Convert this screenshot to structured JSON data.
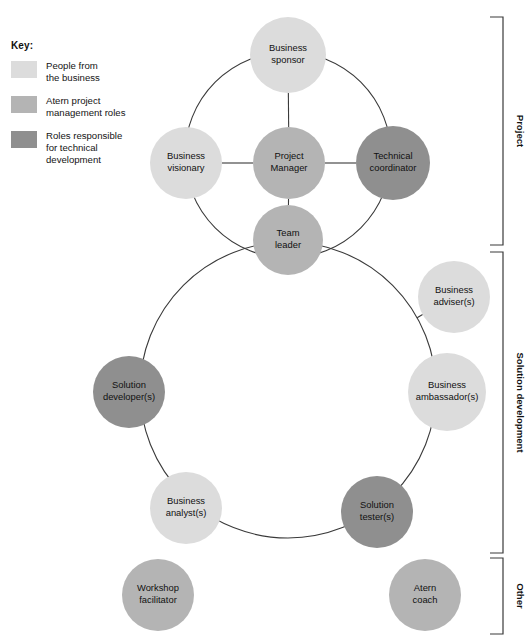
{
  "key": {
    "title": "Key:",
    "items": [
      {
        "color": "#dcdcdc",
        "label": "People from\nthe business"
      },
      {
        "color": "#b4b4b4",
        "label": "Atern project\nmanagement roles"
      },
      {
        "color": "#8f8f8f",
        "label": "Roles responsible\nfor technical\ndevelopment"
      }
    ]
  },
  "colors": {
    "business": "#dcdcdc",
    "management": "#b4b4b4",
    "technical": "#8f8f8f",
    "stroke": "#3a3a3a",
    "text": "#111111",
    "background": "#ffffff"
  },
  "diagram": {
    "nodes": [
      {
        "id": "business-sponsor",
        "lines": [
          "Business",
          "sponsor"
        ],
        "cx": 288,
        "cy": 55,
        "r": 38,
        "category": "business",
        "color": "#dcdcdc"
      },
      {
        "id": "business-visionary",
        "lines": [
          "Business",
          "visionary"
        ],
        "cx": 186,
        "cy": 163,
        "r": 36,
        "category": "business",
        "color": "#dcdcdc"
      },
      {
        "id": "project-manager",
        "lines": [
          "Project",
          "Manager"
        ],
        "cx": 289,
        "cy": 163,
        "r": 36,
        "category": "management",
        "color": "#b4b4b4"
      },
      {
        "id": "technical-coordinator",
        "lines": [
          "Technical",
          "coordinator"
        ],
        "cx": 393,
        "cy": 163,
        "r": 37,
        "category": "technical",
        "color": "#8f8f8f"
      },
      {
        "id": "team-leader",
        "lines": [
          "Team",
          "leader"
        ],
        "cx": 288,
        "cy": 240,
        "r": 35,
        "category": "management",
        "color": "#b4b4b4"
      },
      {
        "id": "business-adviser",
        "lines": [
          "Business",
          "adviser(s)"
        ],
        "cx": 454,
        "cy": 297,
        "r": 36,
        "category": "business",
        "color": "#dcdcdc"
      },
      {
        "id": "solution-developer",
        "lines": [
          "Solution",
          "developer(s)"
        ],
        "cx": 129,
        "cy": 392,
        "r": 36,
        "category": "technical",
        "color": "#8f8f8f"
      },
      {
        "id": "business-ambassador",
        "lines": [
          "Business",
          "ambassador(s)"
        ],
        "cx": 447,
        "cy": 392,
        "r": 39,
        "category": "business",
        "color": "#dcdcdc"
      },
      {
        "id": "business-analyst",
        "lines": [
          "Business",
          "analyst(s)"
        ],
        "cx": 186,
        "cy": 508,
        "r": 36,
        "category": "business",
        "color": "#dcdcdc"
      },
      {
        "id": "solution-tester",
        "lines": [
          "Solution",
          "tester(s)"
        ],
        "cx": 377,
        "cy": 512,
        "r": 36,
        "category": "technical",
        "color": "#8f8f8f"
      },
      {
        "id": "workshop-facilitator",
        "lines": [
          "Workshop",
          "facilitator"
        ],
        "cx": 158,
        "cy": 595,
        "r": 36,
        "category": "management",
        "color": "#b4b4b4"
      },
      {
        "id": "atern-coach",
        "lines": [
          "Atern",
          "coach"
        ],
        "cx": 425,
        "cy": 595,
        "r": 36,
        "category": "management",
        "color": "#b4b4b4"
      }
    ],
    "rings": [
      {
        "id": "project-ring",
        "cx": 288,
        "cy": 155,
        "r": 103
      },
      {
        "id": "solution-development-ring",
        "cx": 288,
        "cy": 390,
        "r": 148
      }
    ],
    "brackets": [
      {
        "id": "bracket-project",
        "label": "Project",
        "top": 17,
        "bottom": 245
      },
      {
        "id": "bracket-solution-development",
        "label": "Solution development",
        "top": 252,
        "bottom": 553
      },
      {
        "id": "bracket-other",
        "label": "Other",
        "top": 558,
        "bottom": 634
      }
    ]
  }
}
